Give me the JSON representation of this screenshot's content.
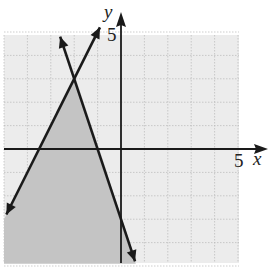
{
  "chart_data": {
    "type": "line",
    "title": "",
    "xlabel": "x",
    "ylabel": "y",
    "xlim": [
      -5,
      5
    ],
    "ylim": [
      -5,
      5
    ],
    "grid": true,
    "tick_labels": {
      "x": "5",
      "y": "5"
    },
    "series": [
      {
        "name": "line-1",
        "equation": "y = -3x - 3",
        "points": [
          [
            -2.6,
            4.8
          ],
          [
            0.6,
            -4.8
          ]
        ],
        "arrows": "both"
      },
      {
        "name": "line-2",
        "equation": "y = 2x + 7",
        "points": [
          [
            -4.9,
            -2.8
          ],
          [
            -0.9,
            5.2
          ]
        ],
        "arrows": "both"
      }
    ],
    "shaded_region": {
      "description": "Region below both lines (y <= 2x + 7 and y <= -3x - 3)",
      "vertex": [
        -2,
        3
      ],
      "color": "#c8c8c8"
    }
  },
  "colors": {
    "grid_bg": "#ececec",
    "shade": "#c4c4c4",
    "line": "#1a1a1a"
  }
}
